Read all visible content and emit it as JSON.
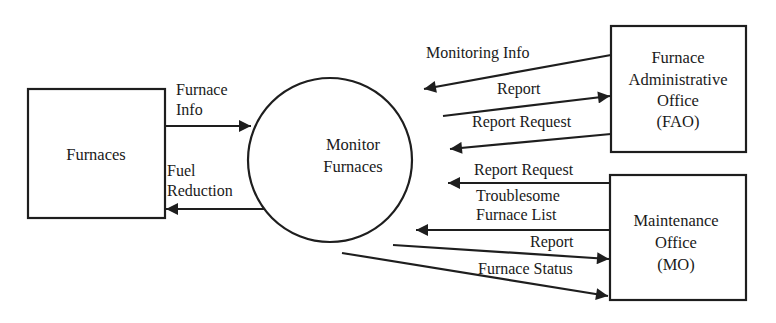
{
  "diagram": {
    "type": "data-flow-diagram",
    "process": {
      "label_lines": [
        "Monitor",
        "Furnaces"
      ]
    },
    "external_entities": [
      {
        "id": "furnaces",
        "label_lines": [
          "Furnaces"
        ]
      },
      {
        "id": "fao",
        "label_lines": [
          "Furnace",
          "Administrative",
          "Office",
          "(FAO)"
        ]
      },
      {
        "id": "mo",
        "label_lines": [
          "Maintenance",
          "Office",
          "(MO)"
        ]
      }
    ],
    "flows": [
      {
        "id": "furnace-info",
        "from": "furnaces",
        "to": "process",
        "label_lines": [
          "Furnace",
          "Info"
        ]
      },
      {
        "id": "fuel-reduction",
        "from": "process",
        "to": "furnaces",
        "label_lines": [
          "Fuel",
          "Reduction"
        ]
      },
      {
        "id": "monitoring-info",
        "from": "fao",
        "to": "process",
        "label_lines": [
          "Monitoring Info"
        ]
      },
      {
        "id": "report-fao",
        "from": "process",
        "to": "fao",
        "label_lines": [
          "Report"
        ]
      },
      {
        "id": "report-request-fao",
        "from": "fao",
        "to": "process",
        "label_lines": [
          "Report Request"
        ]
      },
      {
        "id": "report-request-mo",
        "from": "mo",
        "to": "process",
        "label_lines": [
          "Report Request"
        ]
      },
      {
        "id": "troublesome-furnace-list",
        "from": "mo",
        "to": "process",
        "label_lines": [
          "Troublesome",
          "Furnace List"
        ]
      },
      {
        "id": "report-mo",
        "from": "process",
        "to": "mo",
        "label_lines": [
          "Report"
        ]
      },
      {
        "id": "furnace-status",
        "from": "process",
        "to": "mo",
        "label_lines": [
          "Furnace Status"
        ]
      }
    ]
  },
  "colors": {
    "stroke": "#1e1e1e",
    "text": "#1a1a1a",
    "background": "#ffffff"
  }
}
